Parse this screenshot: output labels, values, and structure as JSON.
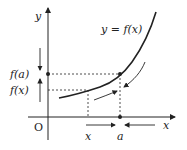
{
  "diagram": {
    "curve_label": "y = f(x)",
    "y_axis_label": "y",
    "x_axis_label": "x",
    "origin_label": "O",
    "fa_label": "f(a)",
    "fx_label": "f(x)",
    "x_tick_label": "x",
    "a_tick_label": "a",
    "colors": {
      "ink": "#222222",
      "background": "#ffffff"
    }
  }
}
